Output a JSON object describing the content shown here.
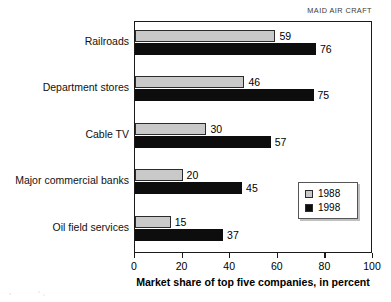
{
  "header": {
    "source_caption": "MAID AIR CRAFT"
  },
  "chart_data": {
    "type": "bar",
    "orientation": "horizontal",
    "title": "",
    "xlabel": "Market share of top five companies, in percent",
    "ylabel": "",
    "xlim": [
      0,
      100
    ],
    "xticks": [
      "0",
      "20",
      "40",
      "60",
      "80",
      "100"
    ],
    "grid": false,
    "legend_position": "lower-right",
    "categories": [
      "Railroads",
      "Department stores",
      "Cable TV",
      "Major commercial banks",
      "Oil field services"
    ],
    "series": [
      {
        "name": "1988",
        "color": "#c9c9c9",
        "values": [
          59,
          46,
          30,
          20,
          15
        ],
        "labels": [
          "59",
          "46",
          "30",
          "20",
          "15"
        ]
      },
      {
        "name": "1998",
        "color": "#0d0d0d",
        "values": [
          76,
          75,
          57,
          45,
          37
        ],
        "labels": [
          "76",
          "75",
          "57",
          "45",
          "37"
        ]
      }
    ]
  },
  "legend": {
    "entries": [
      {
        "label": "1988"
      },
      {
        "label": "1998"
      }
    ]
  }
}
